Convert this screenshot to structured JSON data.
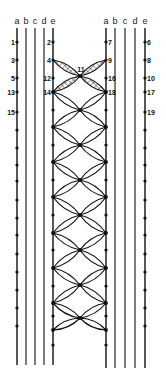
{
  "diagram": {
    "type": "lace-pricking",
    "left_group": {
      "threads": [
        "a",
        "b",
        "c",
        "d",
        "e"
      ],
      "x": [
        17,
        26,
        35,
        44,
        53
      ],
      "y_end": 365,
      "pins_a": [
        {
          "label": "1",
          "y": 42
        },
        {
          "label": "3",
          "y": 60
        },
        {
          "label": "5",
          "y": 78
        },
        {
          "label": "13",
          "y": 92
        },
        {
          "label": "15",
          "y": 112
        }
      ],
      "pins_e": [
        {
          "label": "2",
          "y": 42
        },
        {
          "label": "4",
          "y": 60
        },
        {
          "label": "12",
          "y": 78
        },
        {
          "label": "14",
          "y": 92
        }
      ]
    },
    "right_group": {
      "threads": [
        "a",
        "b",
        "c",
        "d",
        "e"
      ],
      "x": [
        106,
        115,
        125,
        135,
        145
      ],
      "y_end": 368,
      "pins_a": [
        {
          "label": "7",
          "y": 42
        },
        {
          "label": "9",
          "y": 60
        },
        {
          "label": "16",
          "y": 78
        },
        {
          "label": "18",
          "y": 92
        }
      ],
      "pins_e": [
        {
          "label": "6",
          "y": 42
        },
        {
          "label": "8",
          "y": 60
        },
        {
          "label": "10",
          "y": 78
        },
        {
          "label": "17",
          "y": 92
        },
        {
          "label": "19",
          "y": 112
        }
      ]
    },
    "center_label": {
      "label": "11",
      "x": 80,
      "y": 76
    },
    "plain_pins_left_a": [
      130,
      148,
      165,
      181,
      200,
      218,
      235,
      254,
      272,
      290,
      308,
      326
    ],
    "plain_pins_right_e": [
      130,
      148,
      165,
      181,
      200,
      218,
      235,
      254,
      272,
      290,
      308,
      326
    ],
    "edge_nodes": [
      92,
      127,
      162,
      197,
      233,
      268,
      303,
      330
    ],
    "edge_plain_pins": [
      110,
      145,
      180,
      215,
      250,
      286,
      316,
      345
    ],
    "center_nodes": [
      76,
      110,
      145,
      180,
      215,
      250,
      285,
      318
    ]
  }
}
